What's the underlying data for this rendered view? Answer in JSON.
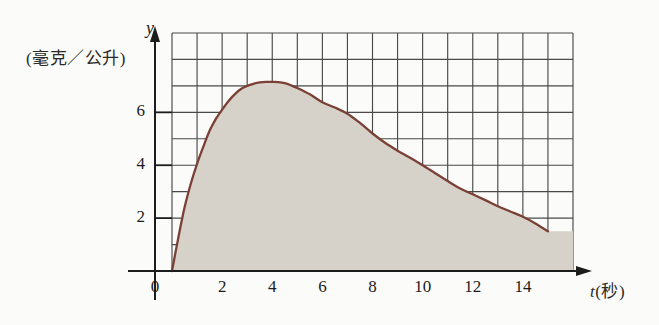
{
  "figure": {
    "background_color": "#fbfbfa",
    "plot_fill_color": "#d6d1c9",
    "grid_line_color": "#4a4a4a",
    "curve_color": "#7a4036",
    "axis_color": "#1c1c1c"
  },
  "axes": {
    "y_axis_name": "y",
    "y_unit_label": "(毫克／公升)",
    "x_axis_name": "t",
    "x_unit_label_full": "t(秒)",
    "x_unit_suffix": "(秒)",
    "origin_label": "0"
  },
  "chart_data": {
    "type": "area",
    "title": "",
    "subtitle": "",
    "xlabel": "t(秒)",
    "ylabel": "(毫克／公升)",
    "xlim": [
      0,
      16
    ],
    "ylim": [
      0,
      9
    ],
    "grid": true,
    "grid_step_x": 1,
    "grid_step_y": 1,
    "legend": "none",
    "x_tick_labels": [
      "0",
      "2",
      "4",
      "6",
      "8",
      "10",
      "12",
      "14"
    ],
    "x_tick_values": [
      0,
      2,
      4,
      6,
      8,
      10,
      12,
      14
    ],
    "y_tick_labels": [
      "0",
      "2",
      "4",
      "6"
    ],
    "y_tick_values": [
      0,
      2,
      4,
      6
    ],
    "annotations": [],
    "series": [
      {
        "name": "concentration",
        "fill": true,
        "x": [
          0,
          0.25,
          0.5,
          0.75,
          1,
          1.25,
          1.5,
          1.75,
          2,
          2.25,
          2.5,
          2.75,
          3,
          3.25,
          3.5,
          3.75,
          4,
          4.25,
          4.5,
          4.75,
          5,
          5.5,
          6,
          6.5,
          7,
          7.5,
          8,
          8.5,
          9,
          9.5,
          10,
          10.5,
          11,
          11.5,
          12,
          12.5,
          13,
          13.5,
          14,
          14.5,
          15
        ],
        "values": [
          0,
          1.25,
          2.4,
          3.3,
          4.05,
          4.7,
          5.3,
          5.75,
          6.1,
          6.42,
          6.68,
          6.88,
          7.0,
          7.08,
          7.13,
          7.15,
          7.15,
          7.14,
          7.1,
          7.02,
          6.92,
          6.68,
          6.38,
          6.18,
          5.95,
          5.6,
          5.2,
          4.85,
          4.55,
          4.28,
          4.0,
          3.7,
          3.4,
          3.12,
          2.9,
          2.68,
          2.45,
          2.25,
          2.05,
          1.8,
          1.5
        ]
      }
    ],
    "peak": {
      "x": 4.2,
      "y": 7.15
    },
    "endpoint": {
      "x": 15,
      "y": 1.5
    }
  },
  "ticks": {
    "x": [
      {
        "label": "0",
        "value": 0
      },
      {
        "label": "2",
        "value": 2
      },
      {
        "label": "4",
        "value": 4
      },
      {
        "label": "6",
        "value": 6
      },
      {
        "label": "8",
        "value": 8
      },
      {
        "label": "10",
        "value": 10
      },
      {
        "label": "12",
        "value": 12
      },
      {
        "label": "14",
        "value": 14
      }
    ],
    "y": [
      {
        "label": "2",
        "value": 2
      },
      {
        "label": "4",
        "value": 4
      },
      {
        "label": "6",
        "value": 6
      }
    ]
  }
}
